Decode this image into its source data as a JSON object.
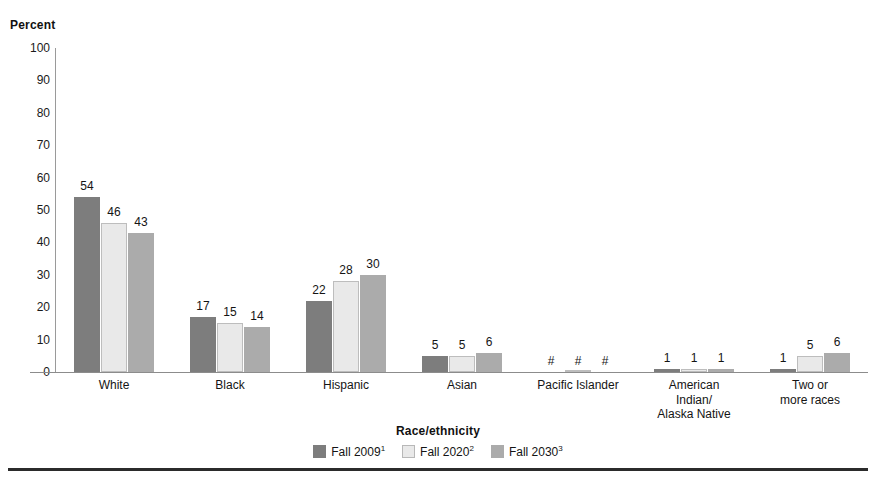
{
  "chart_data": {
    "type": "bar",
    "title": "",
    "xlabel": "Race/ethnicity",
    "ylabel": "Percent",
    "ylim": [
      0,
      100
    ],
    "yticks": [
      100,
      90,
      80,
      70,
      60,
      50,
      40,
      30,
      20,
      10,
      0
    ],
    "grid": false,
    "legend_position": "bottom",
    "categories": [
      "White",
      "Black",
      "Hispanic",
      "Asian",
      "Pacific Islander",
      "American\nIndian/\nAlaska Native",
      "Two or\nmore races"
    ],
    "series": [
      {
        "name": "Fall 2009",
        "footnote": "1",
        "color": "#7d7d7d",
        "values": [
          54,
          17,
          22,
          5,
          0,
          1,
          1
        ],
        "labels": [
          "54",
          "17",
          "22",
          "5",
          "#",
          "1",
          "1"
        ]
      },
      {
        "name": "Fall 2020",
        "footnote": "2",
        "color": "#e9e9e9",
        "values": [
          46,
          15,
          28,
          5,
          0,
          1,
          5
        ],
        "labels": [
          "46",
          "15",
          "28",
          "5",
          "#",
          "1",
          "5"
        ]
      },
      {
        "name": "Fall 2030",
        "footnote": "3",
        "color": "#ababab",
        "values": [
          43,
          14,
          30,
          6,
          0,
          1,
          6
        ],
        "labels": [
          "43",
          "14",
          "30",
          "6",
          "#",
          "1",
          "6"
        ]
      }
    ],
    "annotations": [
      "# rounds to zero"
    ]
  },
  "axes": {
    "y_title": "Percent",
    "x_title": "Race/ethnicity",
    "y_tick_labels": [
      "100",
      "90",
      "80",
      "70",
      "60",
      "50",
      "40",
      "30",
      "20",
      "10",
      "0"
    ]
  },
  "categories_display": [
    {
      "lines": [
        "White"
      ]
    },
    {
      "lines": [
        "Black"
      ]
    },
    {
      "lines": [
        "Hispanic"
      ]
    },
    {
      "lines": [
        "Asian"
      ]
    },
    {
      "lines": [
        "Pacific Islander"
      ]
    },
    {
      "lines": [
        "American",
        "Indian/",
        "Alaska Native"
      ]
    },
    {
      "lines": [
        "Two or",
        "more races"
      ]
    }
  ],
  "legend": [
    {
      "label": "Fall 2009",
      "sup": "1"
    },
    {
      "label": "Fall 2020",
      "sup": "2"
    },
    {
      "label": "Fall 2030",
      "sup": "3"
    }
  ]
}
